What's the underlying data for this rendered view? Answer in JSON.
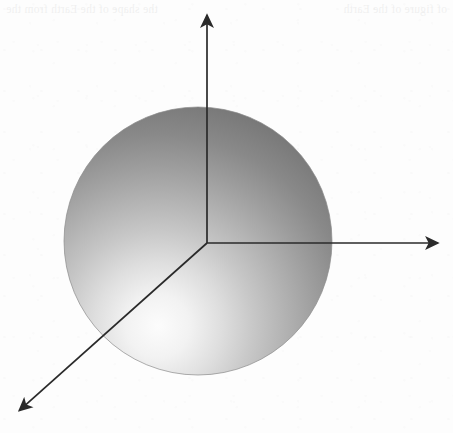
{
  "figure": {
    "caption_present": false,
    "background_color": "#fdfdfd",
    "axis_color": "#2a2a2a",
    "sphere": {
      "name": "earth-sphere",
      "center_x": 198,
      "center_y": 241,
      "radius": 134,
      "highlight_x": 158,
      "highlight_y": 326,
      "highlight_color": "#fbfbfb",
      "midtone_color": "#b4b4b4",
      "shadow_color": "#767676",
      "edge_color": "#8b8b8b"
    },
    "origin": {
      "x": 207,
      "y": 243
    },
    "axes": [
      {
        "name": "axis-z-up",
        "label": "",
        "tip_x": 207,
        "tip_y": 4,
        "direction": "up"
      },
      {
        "name": "axis-x-right",
        "label": "",
        "tip_x": 449,
        "tip_y": 243,
        "direction": "right"
      },
      {
        "name": "axis-y-front-left",
        "label": "",
        "tip_x": 11,
        "tip_y": 418,
        "direction": "down-left"
      }
    ]
  },
  "bleed_through": {
    "left_fragment": "of figure of the Earth",
    "right_fragment": "the shape of the Earth from the"
  }
}
